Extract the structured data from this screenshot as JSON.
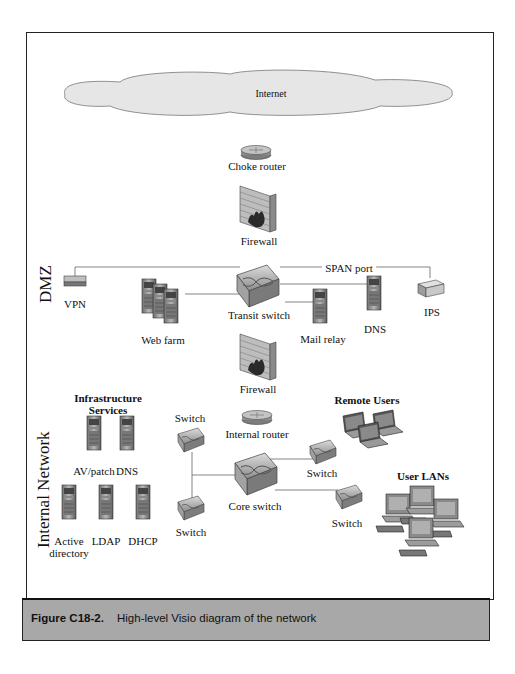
{
  "diagram": {
    "internet_label": "Internet",
    "zones": {
      "dmz": "DMZ",
      "internal": "Internal Network"
    },
    "nodes": {
      "choke_router": "Choke router",
      "firewall_top": "Firewall",
      "vpn": "VPN",
      "web_farm": "Web farm",
      "transit_switch": "Transit switch",
      "span_port": "SPAN port",
      "mail_relay": "Mail relay",
      "dns_dmz": "DNS",
      "ips": "IPS",
      "firewall_bottom": "Firewall",
      "internal_router": "Internal router",
      "remote_users": "Remote Users",
      "infra_title_1": "Infrastructure",
      "infra_title_2": "Services",
      "av_patch": "AV/patch",
      "dns_internal": "DNS",
      "active_directory_1": "Active",
      "active_directory_2": "directory",
      "ldap": "LDAP",
      "dhcp": "DHCP",
      "switch_left_top": "Switch",
      "switch_left_bottom": "Switch",
      "core_switch": "Core switch",
      "switch_right_top": "Switch",
      "switch_right_bottom": "Switch",
      "user_lans": "User LANs"
    },
    "colors": {
      "cloud_fill": "#e6e6e6",
      "device_gray": "#9a9a9a",
      "caption_bg": "#a8a8a8",
      "firewall_brick": "#b5b5b5"
    }
  },
  "caption": {
    "figure_number": "Figure C18-2.",
    "text": "High-level Visio diagram of the network"
  }
}
